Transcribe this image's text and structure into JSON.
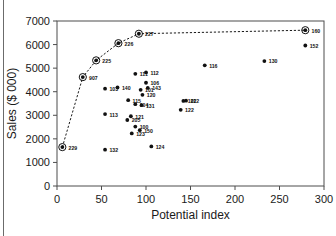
{
  "chart_data": {
    "type": "scatter",
    "title": "",
    "xlabel": "Potential index",
    "ylabel": "Sales ($ 000)",
    "xlim": [
      0,
      300
    ],
    "ylim": [
      0,
      7000
    ],
    "xticks": [
      0,
      50,
      100,
      150,
      200,
      250,
      300
    ],
    "yticks": [
      0,
      1000,
      2000,
      3000,
      4000,
      5000,
      6000,
      7000
    ],
    "grid": false,
    "legend": null,
    "frontier_line": {
      "style": "dashed",
      "description": "dashed efficiency frontier through circled points",
      "points": [
        {
          "x": 6,
          "y": 1650
        },
        {
          "x": 29,
          "y": 4620
        },
        {
          "x": 44,
          "y": 5330
        },
        {
          "x": 69,
          "y": 6060
        },
        {
          "x": 92,
          "y": 6460
        },
        {
          "x": 279,
          "y": 6610
        }
      ]
    },
    "points": [
      {
        "label": "229",
        "x": 6,
        "y": 1650,
        "circled": true
      },
      {
        "label": "907",
        "x": 29,
        "y": 4620,
        "circled": true
      },
      {
        "label": "225",
        "x": 44,
        "y": 5330,
        "circled": true
      },
      {
        "label": "226",
        "x": 69,
        "y": 6060,
        "circled": true
      },
      {
        "label": "227",
        "x": 92,
        "y": 6460,
        "circled": true
      },
      {
        "label": "160",
        "x": 279,
        "y": 6610,
        "circled": true
      },
      {
        "label": "152",
        "x": 279,
        "y": 5960,
        "circled": false
      },
      {
        "label": "130",
        "x": 233,
        "y": 5300,
        "circled": false
      },
      {
        "label": "116",
        "x": 166,
        "y": 5120,
        "circled": false
      },
      {
        "label": "111",
        "x": 88,
        "y": 4760,
        "circled": false
      },
      {
        "label": "112",
        "x": 100,
        "y": 4820,
        "circled": false
      },
      {
        "label": "106",
        "x": 100,
        "y": 4380,
        "circled": false
      },
      {
        "label": "140",
        "x": 68,
        "y": 4180,
        "circled": false
      },
      {
        "label": "103",
        "x": 54,
        "y": 4130,
        "circled": false
      },
      {
        "label": "143",
        "x": 102,
        "y": 4160,
        "circled": false
      },
      {
        "label": "101",
        "x": 94,
        "y": 4080,
        "circled": false
      },
      {
        "label": "120",
        "x": 96,
        "y": 3870,
        "circled": false
      },
      {
        "label": "115",
        "x": 80,
        "y": 3640,
        "circled": false
      },
      {
        "label": "104",
        "x": 88,
        "y": 3470,
        "circled": false
      },
      {
        "label": "131",
        "x": 95,
        "y": 3430,
        "circled": false
      },
      {
        "label": "212",
        "x": 145,
        "y": 3620,
        "circled": false
      },
      {
        "label": "102",
        "x": 142,
        "y": 3610,
        "circled": false
      },
      {
        "label": "122",
        "x": 139,
        "y": 3230,
        "circled": false
      },
      {
        "label": "113",
        "x": 54,
        "y": 3050,
        "circled": false
      },
      {
        "label": "121",
        "x": 83,
        "y": 2960,
        "circled": false
      },
      {
        "label": "205",
        "x": 79,
        "y": 2800,
        "circled": false
      },
      {
        "label": "100",
        "x": 88,
        "y": 2520,
        "circled": false
      },
      {
        "label": "150",
        "x": 93,
        "y": 2370,
        "circled": false
      },
      {
        "label": "123",
        "x": 84,
        "y": 2230,
        "circled": false
      },
      {
        "label": "132",
        "x": 54,
        "y": 1540,
        "circled": false
      },
      {
        "label": "124",
        "x": 106,
        "y": 1680,
        "circled": false
      }
    ]
  }
}
